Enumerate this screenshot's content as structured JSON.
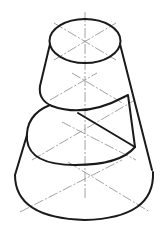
{
  "figure": {
    "type": "isometric-technical-drawing",
    "subject": "truncated cone with a helical/step cut",
    "colors": {
      "outline": "#1a1a1a",
      "centerline": "#8a8a8a",
      "background": "#ffffff"
    },
    "parts": [
      {
        "name": "top-ellipse",
        "cx": 85,
        "cy": 41,
        "rx": 36,
        "ry": 22
      },
      {
        "name": "middle-ellipse",
        "cx": 85,
        "cy": 140,
        "rx": 55,
        "ry": 33
      },
      {
        "name": "bottom-ellipse",
        "cx": 85,
        "cy": 173,
        "rx": 70,
        "ry": 46
      }
    ],
    "text": []
  }
}
